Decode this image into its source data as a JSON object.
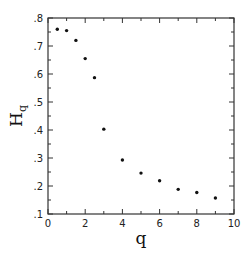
{
  "chart_data": {
    "type": "scatter",
    "title": "",
    "xlabel": "q",
    "ylabel": "H",
    "ylabel_subscript": "q",
    "xlim": [
      0,
      10
    ],
    "ylim": [
      0.1,
      0.8
    ],
    "grid": false,
    "legend": null,
    "x_ticks": [
      0,
      2,
      4,
      6,
      8,
      10
    ],
    "x_tick_labels": [
      "0",
      "2",
      "4",
      "6",
      "8",
      "10"
    ],
    "x_minor_ticks": [
      1,
      3,
      5,
      7,
      9
    ],
    "y_ticks": [
      0.1,
      0.2,
      0.3,
      0.4,
      0.5,
      0.6,
      0.7,
      0.8
    ],
    "y_tick_labels": [
      ".1",
      ".2",
      ".3",
      ".4",
      ".5",
      ".6",
      ".7",
      ".8"
    ],
    "y_minor_ticks": [
      0.15,
      0.25,
      0.35,
      0.45,
      0.55,
      0.65,
      0.75
    ],
    "series": [
      {
        "name": "Hq",
        "marker": "dot",
        "color": "#111111",
        "x": [
          0.5,
          1.0,
          1.5,
          2.0,
          2.5,
          3.0,
          4.0,
          5.0,
          6.0,
          7.0,
          8.0,
          9.0
        ],
        "y": [
          0.76,
          0.755,
          0.72,
          0.655,
          0.587,
          0.403,
          0.293,
          0.246,
          0.219,
          0.188,
          0.177,
          0.157
        ]
      }
    ]
  }
}
